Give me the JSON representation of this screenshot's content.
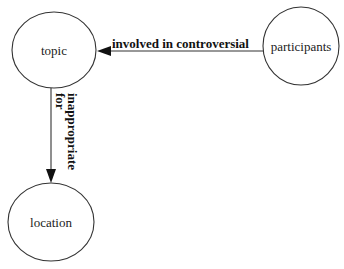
{
  "diagram": {
    "type": "concept-graph",
    "nodes": [
      {
        "id": "topic",
        "label": "topic"
      },
      {
        "id": "participants",
        "label": "participants"
      },
      {
        "id": "location",
        "label": "location"
      }
    ],
    "edges": [
      {
        "from": "participants",
        "to": "topic",
        "label": "involved in controversial"
      },
      {
        "from": "topic",
        "to": "location",
        "label_line1": "inappropriate",
        "label_line2": "for"
      }
    ]
  },
  "colors": {
    "stroke": "#333333",
    "text": "#222222",
    "background": "#ffffff"
  }
}
